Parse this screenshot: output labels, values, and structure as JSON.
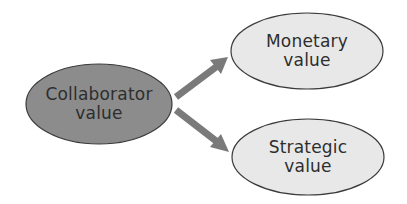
{
  "diagram": {
    "source_node": {
      "label_line1": "Collaborator",
      "label_line2": "value",
      "fill": "#8c8c8c"
    },
    "target_nodes": [
      {
        "label_line1": "Monetary",
        "label_line2": "value",
        "fill": "#e8e8e8"
      },
      {
        "label_line1": "Strategic",
        "label_line2": "value",
        "fill": "#e8e8e8"
      }
    ],
    "arrow_color": "#7a7a7a",
    "outline_color": "#3a3a3a"
  }
}
